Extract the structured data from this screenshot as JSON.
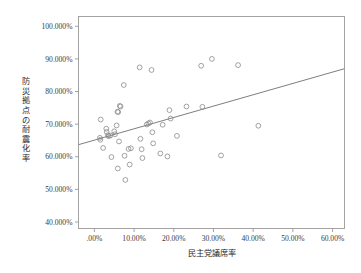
{
  "chart_data": {
    "type": "scatter",
    "title": "",
    "xlabel": "民主党議席率",
    "ylabel": "防災拠点の耐震化率",
    "xlim": [
      -4.0,
      63.0
    ],
    "ylim": [
      38.0,
      103.0
    ],
    "xticks": [
      0,
      10,
      20,
      30,
      40,
      50,
      60
    ],
    "xtick_labels": [
      ".00%",
      "10.00%",
      "20.00%",
      "30.00%",
      "40.00%",
      "50.00%",
      "60.00%"
    ],
    "yticks": [
      40,
      50,
      60,
      70,
      80,
      90,
      100
    ],
    "ytick_labels": [
      "40.000%",
      "50.000%",
      "60.000%",
      "70.000%",
      "80.000%",
      "90.000%",
      "100.000%"
    ],
    "grid": false,
    "legend": false,
    "marker": {
      "shape": "open-circle",
      "radius": 2.4,
      "stroke": "#8a8a8a",
      "fill": "none"
    },
    "frame_color": "#9a9a9a",
    "trendline": {
      "type": "linear",
      "color": "#6f6f6f",
      "x_start": -4.0,
      "y_start": 63.7,
      "x_end": 63.0,
      "y_end": 87.0
    },
    "points": [
      {
        "x": 1.6,
        "y": 71.4
      },
      {
        "x": 1.4,
        "y": 65.8
      },
      {
        "x": 1.5,
        "y": 65.2
      },
      {
        "x": 2.2,
        "y": 62.7
      },
      {
        "x": 3.0,
        "y": 68.6
      },
      {
        "x": 3.1,
        "y": 67.6
      },
      {
        "x": 3.4,
        "y": 66.6
      },
      {
        "x": 3.6,
        "y": 66.3
      },
      {
        "x": 4.0,
        "y": 66.5
      },
      {
        "x": 4.3,
        "y": 59.9
      },
      {
        "x": 5.0,
        "y": 67.8
      },
      {
        "x": 5.2,
        "y": 66.9
      },
      {
        "x": 5.6,
        "y": 69.6
      },
      {
        "x": 5.8,
        "y": 73.8
      },
      {
        "x": 6.0,
        "y": 73.7
      },
      {
        "x": 6.4,
        "y": 75.6
      },
      {
        "x": 6.6,
        "y": 75.4
      },
      {
        "x": 6.2,
        "y": 64.7
      },
      {
        "x": 5.9,
        "y": 56.4
      },
      {
        "x": 7.4,
        "y": 82.0
      },
      {
        "x": 7.6,
        "y": 60.3
      },
      {
        "x": 7.8,
        "y": 52.9
      },
      {
        "x": 8.6,
        "y": 62.4
      },
      {
        "x": 8.9,
        "y": 57.6
      },
      {
        "x": 9.2,
        "y": 62.6
      },
      {
        "x": 11.4,
        "y": 87.4
      },
      {
        "x": 11.6,
        "y": 65.5
      },
      {
        "x": 11.9,
        "y": 62.3
      },
      {
        "x": 12.1,
        "y": 59.6
      },
      {
        "x": 13.2,
        "y": 69.9
      },
      {
        "x": 13.6,
        "y": 70.2
      },
      {
        "x": 14.0,
        "y": 70.5
      },
      {
        "x": 14.4,
        "y": 86.6
      },
      {
        "x": 14.6,
        "y": 67.5
      },
      {
        "x": 14.8,
        "y": 64.1
      },
      {
        "x": 16.6,
        "y": 61.0
      },
      {
        "x": 17.2,
        "y": 69.8
      },
      {
        "x": 18.9,
        "y": 74.3
      },
      {
        "x": 18.4,
        "y": 60.1
      },
      {
        "x": 19.2,
        "y": 71.7
      },
      {
        "x": 20.8,
        "y": 66.4
      },
      {
        "x": 23.2,
        "y": 75.4
      },
      {
        "x": 26.9,
        "y": 87.9
      },
      {
        "x": 27.2,
        "y": 75.3
      },
      {
        "x": 29.6,
        "y": 90.0
      },
      {
        "x": 31.9,
        "y": 60.4
      },
      {
        "x": 36.2,
        "y": 88.1
      },
      {
        "x": 41.3,
        "y": 69.5
      }
    ]
  }
}
